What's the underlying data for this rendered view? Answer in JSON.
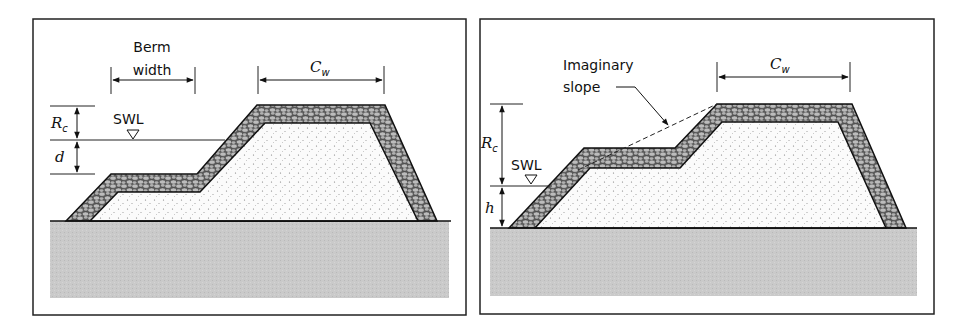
{
  "figure": {
    "panels": [
      {
        "id": "left",
        "title": "Bermed breakwater with berm below crest",
        "labels": {
          "berm_line1": "Berm",
          "berm_line2": "width",
          "crest_width": "C",
          "crest_width_sub": "w",
          "freeboard": "R",
          "freeboard_sub": "c",
          "water_depth": "d",
          "swl": "SWL"
        }
      },
      {
        "id": "right",
        "title": "Bermed breakwater with imaginary slope",
        "labels": {
          "imaginary_line1": "Imaginary",
          "imaginary_line2": "slope",
          "crest_width": "C",
          "crest_width_sub": "w",
          "freeboard": "R",
          "freeboard_sub": "c",
          "berm_height": "h",
          "swl": "SWL"
        }
      }
    ],
    "colors": {
      "frame": "#222222",
      "ground": "#c8c8c8",
      "armor_fill": "#a9a9a9",
      "armor_stone": "#bdbdbd",
      "core_fill": "#fbfbfb",
      "line": "#1a1a1a"
    }
  }
}
